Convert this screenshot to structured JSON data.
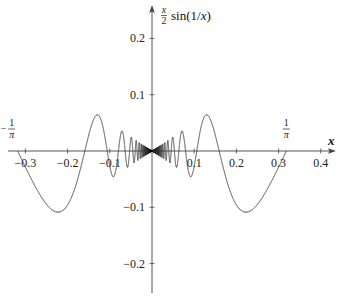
{
  "chart_data": {
    "type": "line",
    "title": "",
    "function": "(x/2) sin(1/x)",
    "xlabel": "x",
    "ylabel": "x/2 sin(1/x)",
    "ylabel_parts": {
      "num": "x",
      "den": "2",
      "rest": "sin(1/x)"
    },
    "domain": [
      -0.3183,
      0.3183
    ],
    "xlim": [
      -0.34,
      0.43
    ],
    "ylim": [
      -0.25,
      0.26
    ],
    "grid": false,
    "legend": null,
    "x_ticks": [
      {
        "value": -0.3,
        "label": "−0.3"
      },
      {
        "value": -0.2,
        "label": "−0.2"
      },
      {
        "value": -0.1,
        "label": "−0.1"
      },
      {
        "value": 0.1,
        "label": "0.1"
      },
      {
        "value": 0.2,
        "label": "0.2"
      },
      {
        "value": 0.3,
        "label": "0.3"
      },
      {
        "value": 0.4,
        "label": "0.4"
      }
    ],
    "y_ticks": [
      {
        "value": 0.2,
        "label": "0.2"
      },
      {
        "value": 0.1,
        "label": "0.1"
      },
      {
        "value": -0.1,
        "label": "−0.1"
      },
      {
        "value": -0.2,
        "label": "−0.2"
      }
    ],
    "annotations": [
      {
        "x": -0.3183,
        "label": "−1/π",
        "sign": "−",
        "num": "1",
        "den": "π"
      },
      {
        "x": 0.3183,
        "label": "1/π",
        "sign": "",
        "num": "1",
        "den": "π"
      }
    ],
    "key_points": [
      {
        "x": -0.3183,
        "y": 0.0
      },
      {
        "x": -0.22,
        "y": -0.108
      },
      {
        "x": -0.13,
        "y": 0.065
      },
      {
        "x": 0.0,
        "y": 0.0
      },
      {
        "x": 0.13,
        "y": 0.065
      },
      {
        "x": 0.22,
        "y": -0.108
      },
      {
        "x": 0.3183,
        "y": 0.0
      }
    ],
    "colors": {
      "curve": "#333333",
      "axes": "#444444"
    }
  },
  "layout": {
    "origin_px": [
      152,
      151
    ],
    "px_per_unit_x": 422,
    "px_per_unit_y": 563,
    "x_axis_px": [
      8,
      336
    ],
    "y_axis_px": [
      293,
      5
    ]
  }
}
